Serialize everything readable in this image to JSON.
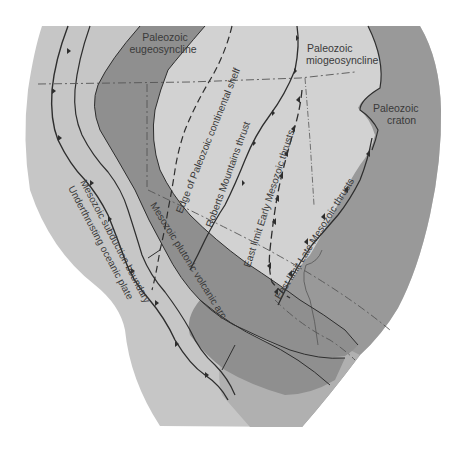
{
  "diagram": {
    "type": "geologic-map",
    "colors": {
      "background": "#ffffff",
      "light_region": "#c6c6c6",
      "shelf_region": "#d2d2d2",
      "mid_region": "#b5b5b5",
      "dark_band": "#8f8f8f",
      "craton": "#999999",
      "line": "#2e2e2e",
      "text": "#3a3a3a"
    },
    "regions": [
      {
        "id": "eugeosyncline",
        "line1": "Paleozoic",
        "line2": "eugeosyncline"
      },
      {
        "id": "miogeosyncline",
        "line1": "Paleozoic",
        "line2": "miogeosyncline"
      },
      {
        "id": "craton",
        "line1": "Paleozoic",
        "line2": "craton"
      }
    ],
    "features": {
      "shelf_edge": "Edge of Paleozoic continental shelf",
      "roberts_mountains": "Roberts Mountains thrust",
      "early_mesozoic": "East limit Early Mesozoic thrusts",
      "late_mesozoic": "East limit Late Mesozoic thrusts",
      "volcanic_arc": "Mesozoic plutonic volcanic arc",
      "subduction": "Mesozoic subduction boundary",
      "oceanic_plate": "Underthrusting oceanic plate"
    }
  }
}
